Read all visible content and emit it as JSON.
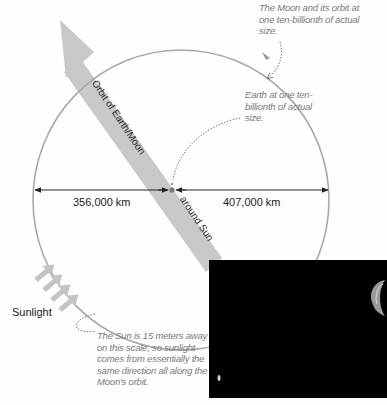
{
  "diagram": {
    "band_label_upper": "Orbit of Earth/Moon",
    "band_label_lower": "around Sun",
    "distance_left": "356,000 km",
    "distance_right": "407,000 km",
    "sunlight_label": "Sunlight",
    "notes": {
      "moon_orbit": "The Moon and its orbit at one ten-billionth of actual size.",
      "earth": "Earth at one ten-billionth of actual size.",
      "sun": "The Sun is 15 meters away on this scale, so sunlight comes from essentially the same direction all along the Moon's orbit."
    },
    "colors": {
      "orbit": "#a8a8a8",
      "band": "#c8c8c8",
      "arrow_line": "#222222",
      "note_text": "#7a7a7a",
      "photo_bg": "#000000"
    }
  },
  "photo": {
    "description": "Earth and Moon photographed from space",
    "objects": [
      "earth-crescent",
      "moon-dot"
    ]
  }
}
